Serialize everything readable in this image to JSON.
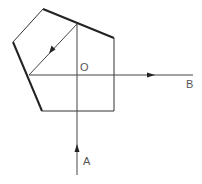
{
  "diagram": {
    "type": "pentaprism-ray-diagram",
    "colors": {
      "background": "#ffffff",
      "stroke": "#222222",
      "ray": "#444444",
      "label": "#555555"
    },
    "prism": {
      "vertices": [
        [
          43,
          9
        ],
        [
          114,
          38
        ],
        [
          114,
          111
        ],
        [
          42,
          111
        ],
        [
          13,
          42
        ]
      ],
      "thick_edges": [
        [
          [
            43,
            9
          ],
          [
            114,
            38
          ]
        ],
        [
          [
            13,
            42
          ],
          [
            42,
            111
          ]
        ]
      ],
      "thin_edges": [
        [
          [
            114,
            38
          ],
          [
            114,
            111
          ]
        ],
        [
          [
            114,
            111
          ],
          [
            42,
            111
          ]
        ],
        [
          [
            13,
            42
          ],
          [
            43,
            9
          ]
        ]
      ]
    },
    "rays": {
      "incoming": {
        "from": [
          77,
          175
        ],
        "to": [
          77,
          24
        ],
        "arrow_at": [
          77,
          145
        ],
        "direction": "up"
      },
      "reflected": {
        "from": [
          77,
          24
        ],
        "to": [
          29,
          75
        ],
        "arrow_at": [
          52,
          50
        ],
        "direction": "down-left"
      },
      "outgoing": {
        "from": [
          29,
          75
        ],
        "to": [
          193,
          75
        ],
        "arrow_at": [
          153,
          75
        ],
        "direction": "right"
      }
    },
    "labels": {
      "center": "O",
      "input": "A",
      "output": "B"
    }
  }
}
